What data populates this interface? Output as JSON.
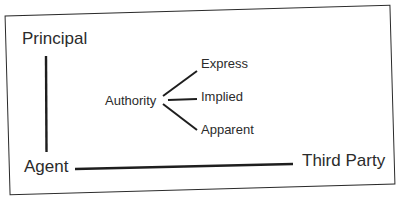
{
  "diagram": {
    "type": "agency-relationship",
    "nodes": {
      "principal": "Principal",
      "agent": "Agent",
      "third_party": "Third Party",
      "authority": "Authority"
    },
    "authority_types": [
      "Express",
      "Implied",
      "Apparent"
    ],
    "edges": [
      {
        "from": "Principal",
        "to": "Agent"
      },
      {
        "from": "Agent",
        "to": "Third Party"
      },
      {
        "from": "Authority",
        "to": "Express"
      },
      {
        "from": "Authority",
        "to": "Implied"
      },
      {
        "from": "Authority",
        "to": "Apparent"
      }
    ],
    "colors": {
      "line": "#1e1e1e",
      "text": "#2b2b2b",
      "background": "#ffffff"
    }
  }
}
